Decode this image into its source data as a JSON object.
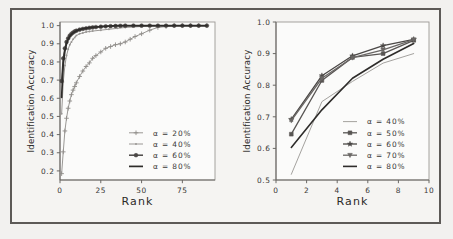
{
  "figure": {
    "background_color": "#f2f1ef",
    "frame_color": "#5d5a57",
    "panels": [
      "left",
      "right"
    ]
  },
  "chart_data": [
    {
      "id": "left",
      "type": "line",
      "title": "",
      "xlabel": "Rank",
      "ylabel": "Identification Accuracy",
      "xlim": [
        0,
        95
      ],
      "ylim": [
        0.15,
        1.02
      ],
      "xticks": [
        0,
        25,
        50,
        75
      ],
      "xticklabels": [
        "0",
        "25",
        "50",
        "75"
      ],
      "yticks": [
        0.2,
        0.3,
        0.4,
        0.5,
        0.6,
        0.7,
        0.8,
        0.9,
        1.0
      ],
      "yticklabels": [
        "0.2",
        "0.3",
        "0.4",
        "0.5",
        "0.6",
        "0.7",
        "0.8",
        "0.9",
        "1.0"
      ],
      "grid": false,
      "legend_position": "lower right",
      "series": [
        {
          "name": "α = 20%",
          "marker": "plus",
          "color": "#8f8c89",
          "linewidth": 0.9,
          "x": [
            1,
            2,
            3,
            4,
            5,
            6,
            7,
            8,
            9,
            10,
            12,
            14,
            16,
            18,
            20,
            22,
            25,
            28,
            31,
            34,
            37,
            40,
            43,
            46,
            50,
            55,
            60,
            65,
            70,
            75,
            80,
            85,
            90
          ],
          "y": [
            0.185,
            0.305,
            0.42,
            0.49,
            0.545,
            0.585,
            0.62,
            0.645,
            0.665,
            0.685,
            0.72,
            0.75,
            0.775,
            0.795,
            0.82,
            0.835,
            0.855,
            0.875,
            0.885,
            0.895,
            0.9,
            0.91,
            0.925,
            0.94,
            0.955,
            0.975,
            0.99,
            0.995,
            1.0,
            1.0,
            1.0,
            1.0,
            1.0
          ]
        },
        {
          "name": "α = 40%",
          "marker": "dot",
          "color": "#9a9794",
          "linewidth": 1.0,
          "x": [
            1,
            2,
            3,
            4,
            5,
            6,
            7,
            8,
            9,
            10,
            12,
            14,
            16,
            18,
            20,
            25,
            30,
            35,
            40,
            50,
            60,
            70,
            80,
            90
          ],
          "y": [
            0.515,
            0.69,
            0.78,
            0.835,
            0.87,
            0.895,
            0.91,
            0.925,
            0.935,
            0.945,
            0.955,
            0.96,
            0.965,
            0.968,
            0.97,
            0.975,
            0.98,
            0.985,
            0.99,
            0.995,
            1.0,
            1.0,
            1.0,
            1.0
          ]
        },
        {
          "name": "α = 60%",
          "marker": "circle",
          "color": "#4a4745",
          "linewidth": 1.5,
          "x": [
            1,
            2,
            3,
            4,
            5,
            6,
            7,
            8,
            9,
            10,
            12,
            14,
            16,
            18,
            20,
            22,
            25,
            28,
            31,
            34,
            37,
            40,
            45,
            50,
            55,
            60,
            65,
            70,
            75,
            80,
            85,
            90
          ],
          "y": [
            0.695,
            0.82,
            0.875,
            0.91,
            0.93,
            0.945,
            0.955,
            0.962,
            0.968,
            0.972,
            0.978,
            0.982,
            0.985,
            0.988,
            0.99,
            0.992,
            0.994,
            0.996,
            0.997,
            0.998,
            0.999,
            1.0,
            1.0,
            1.0,
            1.0,
            1.0,
            1.0,
            1.0,
            1.0,
            1.0,
            1.0,
            1.0
          ]
        },
        {
          "name": "α = 80%",
          "marker": "none",
          "color": "#2e2c2a",
          "linewidth": 1.7,
          "x": [
            1,
            2,
            3,
            4,
            5,
            6,
            7,
            8,
            9,
            10,
            12,
            14,
            16,
            18,
            20,
            25,
            30,
            35,
            40,
            50,
            60,
            70,
            80,
            90
          ],
          "y": [
            0.605,
            0.79,
            0.86,
            0.9,
            0.925,
            0.94,
            0.952,
            0.96,
            0.966,
            0.971,
            0.978,
            0.983,
            0.986,
            0.989,
            0.991,
            0.995,
            0.998,
            1.0,
            1.0,
            1.0,
            1.0,
            1.0,
            1.0,
            1.0
          ]
        }
      ]
    },
    {
      "id": "right",
      "type": "line",
      "title": "",
      "xlabel": "Rank",
      "ylabel": "Identification Accuracy",
      "xlim": [
        0,
        10
      ],
      "ylim": [
        0.5,
        1.0
      ],
      "xticks": [
        0,
        2,
        4,
        6,
        8,
        10
      ],
      "xticklabels": [
        "0",
        "2",
        "4",
        "6",
        "8",
        "10"
      ],
      "yticks": [
        0.5,
        0.6,
        0.7,
        0.8,
        0.9,
        1.0
      ],
      "yticklabels": [
        "0.5",
        "0.6",
        "0.7",
        "0.8",
        "0.9",
        "1.0"
      ],
      "grid": false,
      "legend_position": "lower right",
      "series": [
        {
          "name": "α = 40%",
          "marker": "none",
          "color": "#9a9794",
          "linewidth": 0.9,
          "x": [
            1,
            3,
            5,
            7,
            9
          ],
          "y": [
            0.518,
            0.748,
            0.812,
            0.87,
            0.9
          ]
        },
        {
          "name": "α = 50%",
          "marker": "square",
          "color": "#585553",
          "linewidth": 1.3,
          "x": [
            1,
            3,
            5,
            7,
            9
          ],
          "y": [
            0.645,
            0.815,
            0.888,
            0.9,
            0.942
          ]
        },
        {
          "name": "α = 60%",
          "marker": "star",
          "color": "#4a4745",
          "linewidth": 1.3,
          "x": [
            1,
            3,
            5,
            7,
            9
          ],
          "y": [
            0.692,
            0.83,
            0.893,
            0.925,
            0.945
          ]
        },
        {
          "name": "α = 70%",
          "marker": "triangle-down",
          "color": "#6a6765",
          "linewidth": 1.3,
          "x": [
            1,
            3,
            5,
            7,
            9
          ],
          "y": [
            0.688,
            0.822,
            0.887,
            0.912,
            0.944
          ]
        },
        {
          "name": "α = 80%",
          "marker": "none",
          "color": "#2e2c2a",
          "linewidth": 1.6,
          "x": [
            1,
            3,
            5,
            7,
            9
          ],
          "y": [
            0.603,
            0.722,
            0.822,
            0.882,
            0.932
          ]
        }
      ]
    }
  ]
}
